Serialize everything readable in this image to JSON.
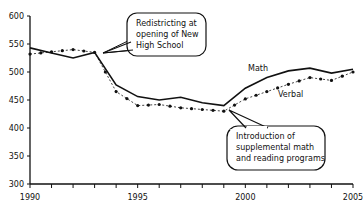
{
  "chart_data": {
    "type": "line",
    "title": "",
    "xlabel": "",
    "ylabel": "",
    "x": [
      1990,
      1991,
      1992,
      1993,
      1994,
      1995,
      1996,
      1997,
      1998,
      1999,
      2000,
      2001,
      2002,
      2003,
      2004,
      2005
    ],
    "xticks": [
      1990,
      1995,
      2000,
      2005
    ],
    "xlim": [
      1990,
      2005
    ],
    "yticks": [
      300,
      350,
      400,
      450,
      500,
      550,
      600
    ],
    "ylim": [
      300,
      600
    ],
    "grid": false,
    "legend": "inline labels",
    "series": [
      {
        "name": "Math",
        "style": "solid",
        "values": [
          543,
          534,
          525,
          535,
          477,
          456,
          450,
          455,
          445,
          440,
          471,
          490,
          502,
          507,
          498,
          505
        ]
      },
      {
        "name": "Verbal",
        "style": "dotted with markers",
        "values": [
          532,
          536,
          540,
          535,
          465,
          440,
          442,
          436,
          433,
          430,
          452,
          465,
          478,
          490,
          485,
          500
        ]
      }
    ],
    "annotations": [
      {
        "text": [
          "Redistricting at",
          "opening of New",
          "High School"
        ],
        "x": 1993
      },
      {
        "text": [
          "Introduction of",
          "supplemental math",
          "and reading programs"
        ],
        "x": 1999
      }
    ]
  },
  "labels": {
    "math": "Math",
    "verbal": "Verbal"
  },
  "callouts": {
    "redistricting": [
      "Redistricting at",
      "opening of New",
      "High School"
    ],
    "programs": [
      "Introduction of",
      "supplemental math",
      "and reading programs"
    ]
  },
  "axis": {
    "x_labels": [
      "1990",
      "1995",
      "2000",
      "2005"
    ],
    "y_labels": [
      "600",
      "550",
      "500",
      "450",
      "400",
      "350",
      "300"
    ]
  }
}
